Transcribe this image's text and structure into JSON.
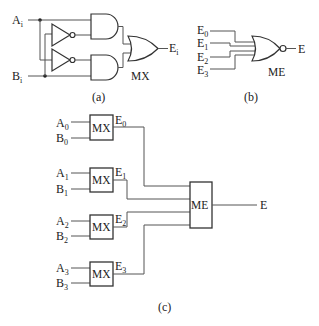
{
  "figure_a": {
    "caption": "(a)",
    "input_a": {
      "base": "A",
      "sub": "i"
    },
    "input_b": {
      "base": "B",
      "sub": "i"
    },
    "output": {
      "base": "E",
      "sub": "i"
    },
    "block_label": "MX"
  },
  "figure_b": {
    "caption": "(b)",
    "inputs": [
      {
        "base": "E",
        "sub": "0"
      },
      {
        "base": "E",
        "sub": "1"
      },
      {
        "base": "E",
        "sub": "2"
      },
      {
        "base": "E",
        "sub": "3"
      }
    ],
    "output": "E",
    "block_label": "ME"
  },
  "figure_c": {
    "caption": "(c)",
    "mx_blocks": [
      {
        "label": "MX",
        "a": {
          "base": "A",
          "sub": "0"
        },
        "b": {
          "base": "B",
          "sub": "0"
        },
        "out": {
          "base": "E",
          "sub": "0"
        }
      },
      {
        "label": "MX",
        "a": {
          "base": "A",
          "sub": "1"
        },
        "b": {
          "base": "B",
          "sub": "1"
        },
        "out": {
          "base": "E",
          "sub": "1"
        }
      },
      {
        "label": "MX",
        "a": {
          "base": "A",
          "sub": "2"
        },
        "b": {
          "base": "B",
          "sub": "2"
        },
        "out": {
          "base": "E",
          "sub": "2"
        }
      },
      {
        "label": "MX",
        "a": {
          "base": "A",
          "sub": "3"
        },
        "b": {
          "base": "B",
          "sub": "3"
        },
        "out": {
          "base": "E",
          "sub": "3"
        }
      }
    ],
    "me_block": {
      "label": "ME"
    },
    "output": "E"
  }
}
